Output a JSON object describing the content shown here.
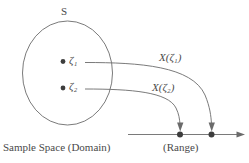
{
  "figure": {
    "title_set": "S",
    "domain_caption": "Sample Space (Domain)",
    "range_caption": "(Range)",
    "stroke_color": "#6b6b6b",
    "text_color": "#4a4a4a",
    "background": "#ffffff"
  },
  "sample_points": [
    {
      "symbol": "ζ",
      "subscript": "1"
    },
    {
      "symbol": "ζ",
      "subscript": "2"
    }
  ],
  "mappings": [
    {
      "label": "X(ζ",
      "subscript": "1",
      "label_close": ")"
    },
    {
      "label": "X(ζ",
      "subscript": "2",
      "label_close": ")"
    }
  ],
  "map_label_1": "X(ζ₁)",
  "map_label_2": "X(ζ₂)",
  "zeta_label_1": "ζ₁",
  "zeta_label_2": "ζ₂"
}
